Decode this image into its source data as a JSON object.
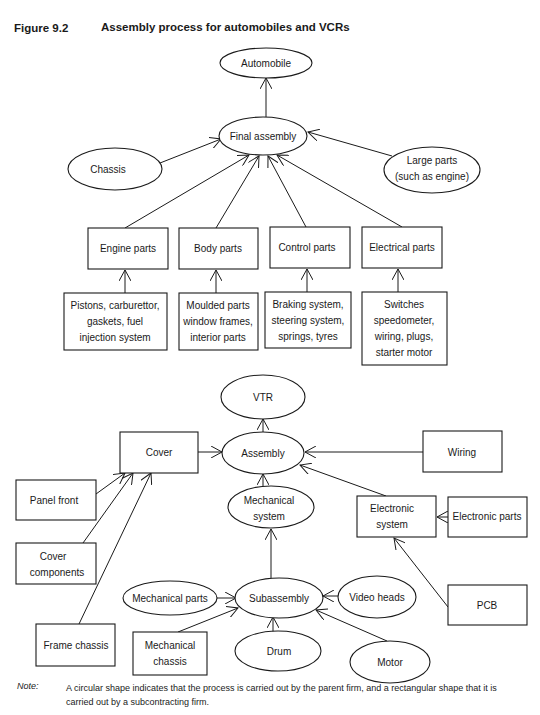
{
  "figure": {
    "label": "Figure 9.2",
    "title": "Assembly process for automobiles and VCRs"
  },
  "legend": {
    "ellipse": "process carried out by the parent firm",
    "rectangle": "process carried out by a subcontracting firm"
  },
  "automobile": {
    "nodes": {
      "automobile": {
        "shape": "ellipse",
        "lines": [
          "Automobile"
        ]
      },
      "final_assembly": {
        "shape": "ellipse",
        "lines": [
          "Final assembly"
        ]
      },
      "chassis": {
        "shape": "ellipse",
        "lines": [
          "Chassis"
        ]
      },
      "large_parts": {
        "shape": "ellipse",
        "lines": [
          "Large parts",
          "(such as engine)"
        ]
      },
      "engine_parts": {
        "shape": "rect",
        "lines": [
          "Engine parts"
        ]
      },
      "body_parts": {
        "shape": "rect",
        "lines": [
          "Body parts"
        ]
      },
      "control_parts": {
        "shape": "rect",
        "lines": [
          "Control parts"
        ]
      },
      "electrical_parts": {
        "shape": "rect",
        "lines": [
          "Electrical parts"
        ]
      },
      "engine_components": {
        "shape": "rect",
        "lines": [
          "Pistons, carburettor,",
          "gaskets, fuel",
          "injection system"
        ]
      },
      "body_components": {
        "shape": "rect",
        "lines": [
          "Moulded parts",
          "window frames,",
          "interior parts"
        ]
      },
      "control_components": {
        "shape": "rect",
        "lines": [
          "Braking system,",
          "steering system,",
          "springs, tyres"
        ]
      },
      "electrical_components": {
        "shape": "rect",
        "lines": [
          "Switches",
          "speedometer,",
          "wiring, plugs,",
          "starter motor"
        ]
      }
    },
    "edges": [
      {
        "from": "final_assembly",
        "to": "automobile"
      },
      {
        "from": "chassis",
        "to": "final_assembly"
      },
      {
        "from": "large_parts",
        "to": "final_assembly"
      },
      {
        "from": "engine_parts",
        "to": "final_assembly"
      },
      {
        "from": "body_parts",
        "to": "final_assembly"
      },
      {
        "from": "control_parts",
        "to": "final_assembly"
      },
      {
        "from": "electrical_parts",
        "to": "final_assembly"
      },
      {
        "from": "engine_components",
        "to": "engine_parts"
      },
      {
        "from": "body_components",
        "to": "body_parts"
      },
      {
        "from": "control_components",
        "to": "control_parts"
      },
      {
        "from": "electrical_components",
        "to": "electrical_parts"
      }
    ]
  },
  "vcr": {
    "nodes": {
      "vtr": {
        "shape": "ellipse",
        "lines": [
          "VTR"
        ]
      },
      "assembly": {
        "shape": "ellipse",
        "lines": [
          "Assembly"
        ]
      },
      "cover": {
        "shape": "rect",
        "lines": [
          "Cover"
        ]
      },
      "wiring": {
        "shape": "rect",
        "lines": [
          "Wiring"
        ]
      },
      "panel_front": {
        "shape": "rect",
        "lines": [
          "Panel front"
        ]
      },
      "cover_components": {
        "shape": "rect",
        "lines": [
          "Cover",
          "components"
        ]
      },
      "frame_chassis": {
        "shape": "rect",
        "lines": [
          "Frame chassis"
        ]
      },
      "mechanical_system": {
        "shape": "ellipse",
        "lines": [
          "Mechanical",
          "system"
        ]
      },
      "electronic_system": {
        "shape": "rect",
        "lines": [
          "Electronic",
          "system"
        ]
      },
      "electronic_parts": {
        "shape": "rect",
        "lines": [
          "Electronic parts"
        ]
      },
      "pcb": {
        "shape": "rect",
        "lines": [
          "PCB"
        ]
      },
      "subassembly": {
        "shape": "ellipse",
        "lines": [
          "Subassembly"
        ]
      },
      "mechanical_parts": {
        "shape": "ellipse",
        "lines": [
          "Mechanical parts"
        ]
      },
      "video_heads": {
        "shape": "ellipse",
        "lines": [
          "Video heads"
        ]
      },
      "mechanical_chassis": {
        "shape": "rect",
        "lines": [
          "Mechanical",
          "chassis"
        ]
      },
      "drum": {
        "shape": "ellipse",
        "lines": [
          "Drum"
        ]
      },
      "motor": {
        "shape": "ellipse",
        "lines": [
          "Motor"
        ]
      }
    },
    "edges": [
      {
        "from": "assembly",
        "to": "vtr"
      },
      {
        "from": "cover",
        "to": "assembly"
      },
      {
        "from": "wiring",
        "to": "assembly"
      },
      {
        "from": "electronic_system",
        "to": "assembly"
      },
      {
        "from": "mechanical_system",
        "to": "assembly"
      },
      {
        "from": "panel_front",
        "to": "cover"
      },
      {
        "from": "cover_components",
        "to": "cover"
      },
      {
        "from": "frame_chassis",
        "to": "cover"
      },
      {
        "from": "electronic_parts",
        "to": "electronic_system"
      },
      {
        "from": "pcb",
        "to": "electronic_system"
      },
      {
        "from": "subassembly",
        "to": "mechanical_system"
      },
      {
        "from": "mechanical_parts",
        "to": "subassembly"
      },
      {
        "from": "video_heads",
        "to": "subassembly"
      },
      {
        "from": "mechanical_chassis",
        "to": "subassembly"
      },
      {
        "from": "drum",
        "to": "subassembly"
      },
      {
        "from": "motor",
        "to": "subassembly"
      }
    ]
  },
  "note": {
    "label": "Note:",
    "text": "A circular shape indicates that the process is carried out by the parent firm, and a rectangular shape that it is carried out by a subcontracting firm."
  }
}
